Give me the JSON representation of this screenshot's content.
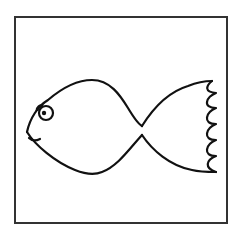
{
  "image": {
    "subject": "Cartoon fish line drawing",
    "style": "black outline on white, framed",
    "colors": {
      "line": "#111111",
      "frame": "#333333",
      "background": "#ffffff"
    },
    "elements": [
      "frame",
      "fish-body",
      "fish-eye",
      "fish-pupil",
      "fish-mouth",
      "fish-tail"
    ]
  }
}
